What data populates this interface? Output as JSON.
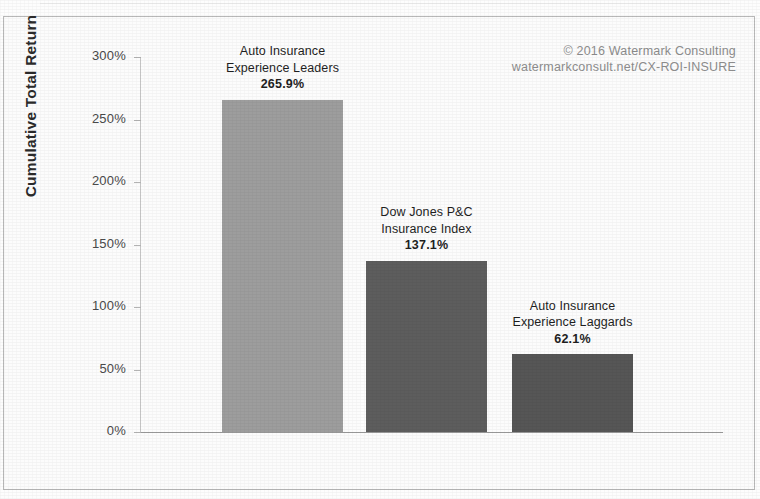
{
  "credit": {
    "line1": "© 2016 Watermark Consulting",
    "line2": "watermarkconsult.net/CX-ROI-INSURE"
  },
  "chart_data": {
    "type": "bar",
    "title": "",
    "xlabel": "",
    "ylabel": "Cumulative Total Return",
    "ylim": [
      0,
      300
    ],
    "ytick_labels": [
      "0%",
      "50%",
      "100%",
      "150%",
      "200%",
      "250%",
      "300%"
    ],
    "ytick_values": [
      0,
      50,
      100,
      150,
      200,
      250,
      300
    ],
    "grid": false,
    "legend": "none",
    "value_suffix": "%",
    "categories": [
      "Auto Insurance Experience Leaders",
      "Dow Jones P&C Insurance Index",
      "Auto Insurance Experience Laggards"
    ],
    "values": [
      265.9,
      137.1,
      62.1
    ],
    "value_labels": [
      "265.9%",
      "137.1%",
      "62.1%"
    ],
    "bars": [
      {
        "name_line1": "Auto Insurance",
        "name_line2": "Experience Leaders",
        "value": 265.9,
        "value_label": "265.9%",
        "color": "#9d9d9d"
      },
      {
        "name_line1": "Dow Jones P&C",
        "name_line2": "Insurance Index",
        "value": 137.1,
        "value_label": "137.1%",
        "color": "#5d5d5d"
      },
      {
        "name_line1": "Auto Insurance",
        "name_line2": "Experience Laggards",
        "value": 62.1,
        "value_label": "62.1%",
        "color": "#565656"
      }
    ]
  }
}
